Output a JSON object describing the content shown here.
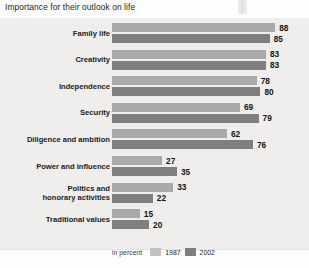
{
  "title": "Importance for their outlook on life",
  "legend": {
    "unit_label": "in percent",
    "entries": [
      {
        "label": "1987",
        "color": "#c2c2c2"
      },
      {
        "label": "2002",
        "color": "#7f7f7f"
      }
    ]
  },
  "chart_data": {
    "type": "bar",
    "orientation": "horizontal",
    "title": "Importance for their outlook on life",
    "xlabel": "in percent",
    "ylabel": "",
    "xlim": [
      0,
      100
    ],
    "grid": false,
    "legend_position": "bottom",
    "categories": [
      "Family life",
      "Creativity",
      "Independence",
      "Security",
      "Diligence and ambition",
      "Power and influence",
      "Politics and honorary activities",
      "Traditional values"
    ],
    "series": [
      {
        "name": "1987",
        "color": "#a9a9a9",
        "values": [
          88,
          83,
          78,
          69,
          62,
          27,
          33,
          15
        ]
      },
      {
        "name": "2002",
        "color": "#7f7f7f",
        "values": [
          85,
          83,
          80,
          79,
          76,
          35,
          22,
          20
        ]
      }
    ]
  },
  "rows": [
    {
      "cat": "Family life",
      "cat_l1": "Family life",
      "cat_l2": "",
      "v1987": 88,
      "v2002": 85
    },
    {
      "cat": "Creativity",
      "cat_l1": "Creativity",
      "cat_l2": "",
      "v1987": 83,
      "v2002": 83
    },
    {
      "cat": "Independence",
      "cat_l1": "Independence",
      "cat_l2": "",
      "v1987": 78,
      "v2002": 80
    },
    {
      "cat": "Security",
      "cat_l1": "Security",
      "cat_l2": "",
      "v1987": 69,
      "v2002": 79
    },
    {
      "cat": "Diligence and ambition",
      "cat_l1": "Diligence and ambition",
      "cat_l2": "",
      "v1987": 62,
      "v2002": 76
    },
    {
      "cat": "Power and influence",
      "cat_l1": "Power and influence",
      "cat_l2": "",
      "v1987": 27,
      "v2002": 35
    },
    {
      "cat": "Politics and honorary activities",
      "cat_l1": "Politics and",
      "cat_l2": "honorary activities",
      "v1987": 33,
      "v2002": 22
    },
    {
      "cat": "Traditional values",
      "cat_l1": "Traditional values",
      "cat_l2": "",
      "v1987": 15,
      "v2002": 20
    }
  ]
}
